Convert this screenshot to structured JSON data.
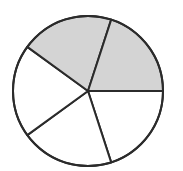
{
  "diagram": {
    "type": "fraction-circle",
    "total_parts": 5,
    "shaded_parts": 2,
    "fraction": "2/5",
    "colors": {
      "stroke": "#2b2b2b",
      "shaded_fill": "#d4d4d4",
      "unshaded_fill": "#ffffff",
      "background": "#ffffff"
    },
    "center": [
      88,
      91
    ],
    "radius": 75,
    "start_angle_deg": 0,
    "sectors": [
      {
        "index": 0,
        "start_deg": 0,
        "end_deg": 72,
        "shaded": false
      },
      {
        "index": 1,
        "start_deg": 72,
        "end_deg": 144,
        "shaded": false
      },
      {
        "index": 2,
        "start_deg": 144,
        "end_deg": 216,
        "shaded": false
      },
      {
        "index": 3,
        "start_deg": 216,
        "end_deg": 288,
        "shaded": true
      },
      {
        "index": 4,
        "start_deg": 288,
        "end_deg": 360,
        "shaded": true
      }
    ]
  }
}
